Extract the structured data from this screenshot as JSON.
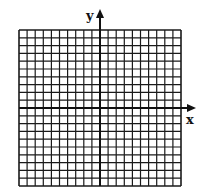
{
  "diagram": {
    "type": "coordinate-grid",
    "columns": 20,
    "rows": 20,
    "x_axis_label": "x",
    "y_axis_label": "y",
    "grid_color": "#1a1a1a",
    "axis_color": "#111111",
    "background": "#ffffff"
  }
}
